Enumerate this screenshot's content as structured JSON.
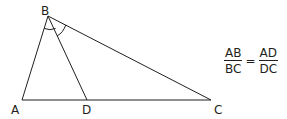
{
  "diagram": {
    "type": "triangle-angle-bisector",
    "line_color": "#231f20",
    "points": {
      "A": {
        "label": "A",
        "x": 22,
        "y": 100
      },
      "B": {
        "label": "B",
        "x": 48,
        "y": 16
      },
      "C": {
        "label": "C",
        "x": 211,
        "y": 100
      },
      "D": {
        "label": "D",
        "x": 87,
        "y": 100
      }
    },
    "segments": [
      "AB",
      "BC",
      "AC",
      "BD"
    ],
    "angle_marks": [
      "ABD",
      "DBC"
    ]
  },
  "formula": {
    "left": {
      "numerator": "AB",
      "denominator": "BC"
    },
    "equals": "=",
    "right": {
      "numerator": "AD",
      "denominator": "DC"
    }
  }
}
